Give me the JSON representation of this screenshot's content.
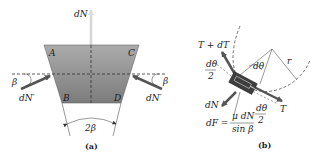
{
  "figure_a": {
    "caption": "(a)",
    "labels": {
      "top_force": "dN",
      "corner_A": "A",
      "corner_B": "B",
      "corner_C": "C",
      "corner_D": "D",
      "left_angle": "β",
      "right_angle": "β",
      "left_force": "dN′",
      "right_force": "dN′",
      "groove_angle": "2β"
    },
    "colors": {
      "fill_top": "#aaaaaa",
      "fill_bottom": "#7a7a7a",
      "arrow": "#555555"
    }
  },
  "figure_b": {
    "caption": "(b)",
    "labels": {
      "tension_upper": "T + dT",
      "tension_lower": "T",
      "half_angle_left_num": "dθ",
      "half_angle_left_den": "2",
      "half_angle_right_num": "dθ",
      "half_angle_right_den": "2",
      "center_angle": "dθ",
      "radius": "r",
      "normal": "dN",
      "friction_lhs": "dF =",
      "friction_num": "μ dN",
      "friction_den": "sin β"
    },
    "colors": {
      "belt": "#555555",
      "element": "#444444"
    }
  }
}
